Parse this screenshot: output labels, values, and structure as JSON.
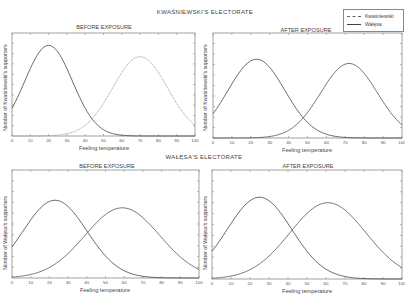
{
  "figure": {
    "top_section_title": "KWAŚNIEWSKI'S ELECTORATE",
    "bottom_section_title": "WAŁĘSA'S ELECTORATE",
    "legend": [
      {
        "label": "Kwaśniewski",
        "style": "dashed"
      },
      {
        "label": "Wałęsa",
        "style": "solid"
      }
    ]
  },
  "chart_data": [
    {
      "type": "line",
      "section": "KWAŚNIEWSKI'S ELECTORATE",
      "title": "BEFORE EXPOSURE",
      "xlabel": "Feeling temperature",
      "ylabel": "Number of Kwaśniewski's supporters",
      "xlim": [
        0,
        100
      ],
      "xticks": [
        0,
        10,
        20,
        30,
        40,
        50,
        60,
        70,
        80,
        90,
        100
      ],
      "box": {
        "x": 12,
        "y": 33,
        "w": 183,
        "h": 103
      },
      "series": [
        {
          "name": "Wałęsa",
          "style": "solid",
          "color": "#444444",
          "peak_x": 20,
          "peak_y": 0.88,
          "sigma": 13
        },
        {
          "name": "Kwaśniewski",
          "style": "dashed",
          "color": "#9a9a9a",
          "peak_x": 70,
          "peak_y": 0.77,
          "sigma": 15
        }
      ]
    },
    {
      "type": "line",
      "section": "KWAŚNIEWSKI'S ELECTORATE",
      "title": "AFTER EXPOSURE",
      "xlabel": "Feeling temperature",
      "ylabel": "Number of Kwaśniewski's supporters",
      "xlim": [
        0,
        100
      ],
      "xticks": [
        0,
        10,
        20,
        30,
        40,
        50,
        60,
        70,
        80,
        90,
        100
      ],
      "box": {
        "x": 213,
        "y": 33,
        "w": 189,
        "h": 105
      },
      "series": [
        {
          "name": "Wałęsa",
          "style": "solid",
          "color": "#444444",
          "peak_x": 23,
          "peak_y": 0.75,
          "sigma": 15
        },
        {
          "name": "Kwaśniewski",
          "style": "solid",
          "color": "#555555",
          "peak_x": 72,
          "peak_y": 0.71,
          "sigma": 15
        }
      ]
    },
    {
      "type": "line",
      "section": "WAŁĘSA'S ELECTORATE",
      "title": "BEFORE EXPOSURE",
      "xlabel": "Feeling temperature",
      "ylabel": "Number of Wałęsa's supporters",
      "xlim": [
        0,
        100
      ],
      "xticks": [
        0,
        10,
        20,
        30,
        40,
        50,
        60,
        70,
        80,
        90,
        100
      ],
      "box": {
        "x": 12,
        "y": 170,
        "w": 187,
        "h": 108
      },
      "series": [
        {
          "name": "Wałęsa",
          "style": "solid",
          "color": "#444444",
          "peak_x": 23,
          "peak_y": 0.72,
          "sigma": 17
        },
        {
          "name": "Kwaśniewski",
          "style": "solid",
          "color": "#555555",
          "peak_x": 59,
          "peak_y": 0.65,
          "sigma": 20
        }
      ]
    },
    {
      "type": "line",
      "section": "WAŁĘSA'S ELECTORATE",
      "title": "AFTER EXPOSURE",
      "xlabel": "Feeling temperature",
      "ylabel": "Number of Wałęsa's supporters",
      "xlim": [
        0,
        100
      ],
      "xticks": [
        0,
        10,
        20,
        30,
        40,
        50,
        60,
        70,
        80,
        90,
        100
      ],
      "box": {
        "x": 212,
        "y": 170,
        "w": 190,
        "h": 109
      },
      "series": [
        {
          "name": "Wałęsa",
          "style": "solid",
          "color": "#444444",
          "peak_x": 25,
          "peak_y": 0.75,
          "sigma": 17
        },
        {
          "name": "Kwaśniewski",
          "style": "solid",
          "color": "#555555",
          "peak_x": 61,
          "peak_y": 0.7,
          "sigma": 20
        }
      ]
    }
  ]
}
